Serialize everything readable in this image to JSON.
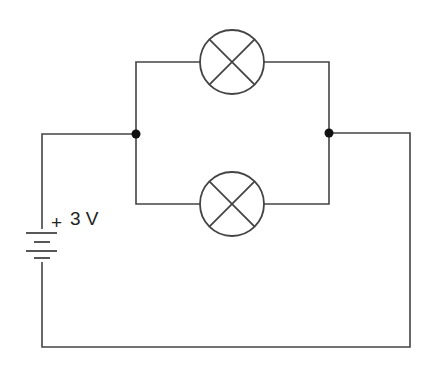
{
  "diagram": {
    "type": "circuit-schematic",
    "battery": {
      "label_sign": "+",
      "label_voltage": "3 V"
    },
    "components": [
      {
        "id": "lamp-top",
        "kind": "lamp"
      },
      {
        "id": "lamp-bottom",
        "kind": "lamp"
      }
    ],
    "junctions": 2,
    "colors": {
      "wire": "#444444",
      "junction": "#111111",
      "background": "#ffffff"
    }
  }
}
